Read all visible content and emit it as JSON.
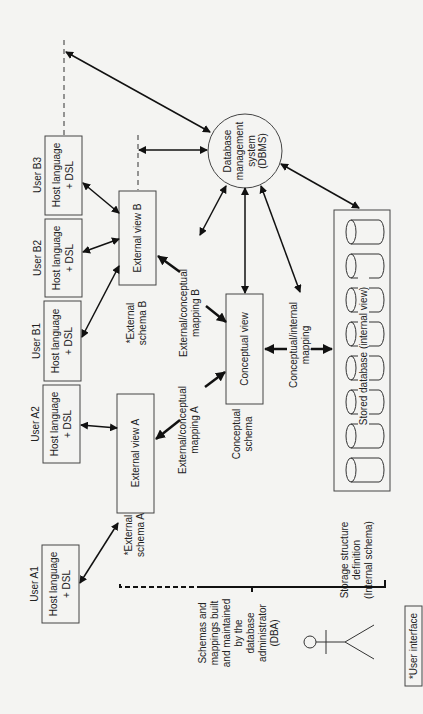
{
  "users": [
    {
      "label": "User A1",
      "box_line1": "Host language",
      "box_line2": "+ DSL"
    },
    {
      "label": "User A2",
      "box_line1": "Host language",
      "box_line2": "+ DSL"
    },
    {
      "label": "User B1",
      "box_line1": "Host language",
      "box_line2": "+ DSL"
    },
    {
      "label": "User B2",
      "box_line1": "Host language",
      "box_line2": "+ DSL"
    },
    {
      "label": "User B3",
      "box_line1": "Host language",
      "box_line2": "+ DSL"
    }
  ],
  "external_views": {
    "a": {
      "label": "External view A",
      "schema_line1": "*External",
      "schema_line2": "schema A"
    },
    "b": {
      "label": "External view B",
      "schema_line1": "*External",
      "schema_line2": "schema B"
    }
  },
  "mappings": {
    "ext_conc_a": {
      "line1": "External/conceptual",
      "line2": "mapping A"
    },
    "ext_conc_b": {
      "line1": "External/conceptual",
      "line2": "mapping B"
    },
    "conc_int": {
      "line1": "Conceptual/internal",
      "line2": "mapping"
    }
  },
  "conceptual": {
    "label": "Conceptual view",
    "schema_line1": "Conceptual",
    "schema_line2": "schema"
  },
  "dbms": {
    "line1": "Database",
    "line2": "management",
    "line3": "system",
    "line4": "(DBMS)"
  },
  "storage": {
    "label": "Stored database (internal view)",
    "def_line1": "Storage structure",
    "def_line2": "definition",
    "def_line3": "(Internal schema)",
    "cylinder_count": 8
  },
  "dba": {
    "line1": "Schemas and",
    "line2": "mappings built",
    "line3": "and maintained",
    "line4": "by the",
    "line5": "database",
    "line6": "administrator",
    "line7": "(DBA)"
  },
  "legend": {
    "label": "*User interface"
  }
}
